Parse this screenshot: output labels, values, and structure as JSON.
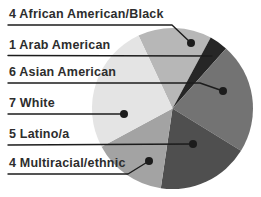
{
  "figure": {
    "background": "#ffffff",
    "text_color": "#2d2d2d",
    "leader_line_color": "#1c1c1c"
  },
  "legend": {
    "items": [
      {
        "text": "4 African American/Black"
      },
      {
        "text": "1 Arab American"
      },
      {
        "text": "6 Asian American"
      },
      {
        "text": "7 White"
      },
      {
        "text": "5 Latino/a"
      },
      {
        "text": "4 Multiracial/ethnic"
      }
    ]
  },
  "chart_data": {
    "type": "pie",
    "total": 27,
    "direction": "clockwise",
    "start_angle_deg": 335,
    "legend_position": "left",
    "slices": [
      {
        "label": "African American/Black",
        "value": 4,
        "color": "#b7b7b7"
      },
      {
        "label": "Arab American",
        "value": 1,
        "color": "#262626"
      },
      {
        "label": "Asian American",
        "value": 6,
        "color": "#737373"
      },
      {
        "label": "Latino/a",
        "value": 5,
        "color": "#4f4f4f"
      },
      {
        "label": "Multiracial/ethnic",
        "value": 4,
        "color": "#a3a3a3"
      },
      {
        "label": "White",
        "value": 7,
        "color": "#e4e4e4"
      }
    ]
  }
}
